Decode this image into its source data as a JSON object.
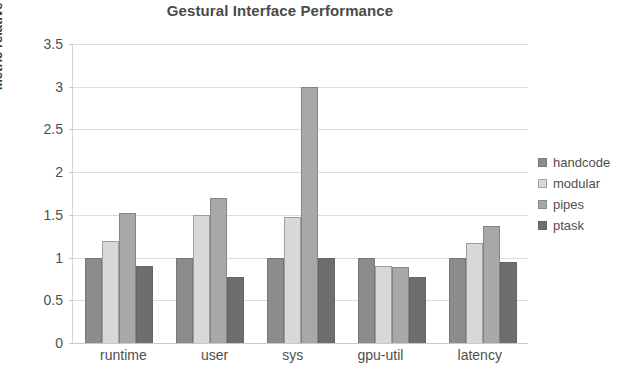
{
  "chart_data": {
    "type": "bar",
    "title": "Gestural Interface Performance",
    "xlabel": "",
    "ylabel": "Metric relative to handcode",
    "categories": [
      "runtime",
      "user",
      "sys",
      "gpu-util",
      "latency"
    ],
    "series": [
      {
        "name": "handcode",
        "color": "#8c8c8c",
        "values": [
          1.0,
          1.0,
          1.0,
          1.0,
          1.0
        ]
      },
      {
        "name": "modular",
        "color": "#d8d8d8",
        "values": [
          1.2,
          1.5,
          1.48,
          0.9,
          1.17
        ]
      },
      {
        "name": "pipes",
        "color": "#a8a8a8",
        "values": [
          1.52,
          1.7,
          3.0,
          0.89,
          1.37
        ]
      },
      {
        "name": "ptask",
        "color": "#6e6e6e",
        "values": [
          0.9,
          0.77,
          1.0,
          0.77,
          0.95
        ]
      }
    ],
    "ylim": [
      0,
      3.5
    ],
    "yticks": [
      "0",
      "0.5",
      "1",
      "1.5",
      "2",
      "2.5",
      "3",
      "3.5"
    ],
    "ytick_values": [
      0,
      0.5,
      1,
      1.5,
      2,
      2.5,
      3,
      3.5
    ],
    "grid": true,
    "legend_position": "right",
    "background_color": "#ffffff",
    "axis_color": "#d4d4d4",
    "grid_color": "#dcdcdc",
    "text_color": "#4f4f4f"
  }
}
